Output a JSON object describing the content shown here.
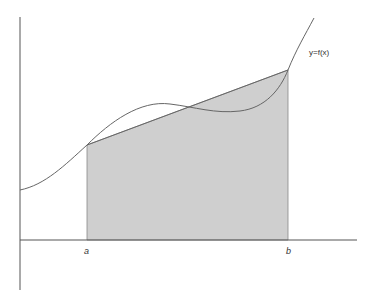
{
  "diagram": {
    "curve_label": "y=f(x)",
    "x_labels": {
      "a": "a",
      "b": "b"
    },
    "colors": {
      "axis": "#555555",
      "curve": "#666666",
      "shade": "#cfcfcf",
      "shade_edge": "#777777",
      "text": "#333333"
    }
  }
}
